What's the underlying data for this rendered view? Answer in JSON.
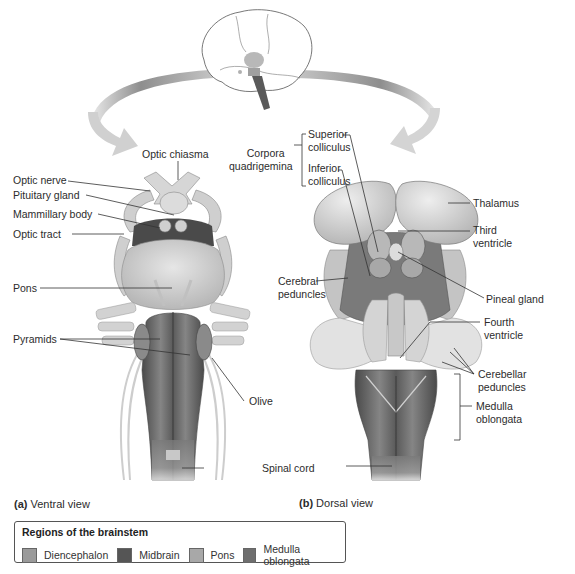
{
  "figure": {
    "views": [
      {
        "id": "a",
        "letter": "(a)",
        "name": "Ventral view"
      },
      {
        "id": "b",
        "letter": "(b)",
        "name": "Dorsal view"
      }
    ],
    "ventral_labels": {
      "optic_nerve": "Optic nerve",
      "optic_chiasma": "Optic chiasma",
      "pituitary_gland": "Pituitary gland",
      "mammillary_body": "Mammillary body",
      "optic_tract": "Optic tract",
      "pons": "Pons",
      "pyramids": "Pyramids",
      "olive": "Olive",
      "spinal_cord": "Spinal cord"
    },
    "dorsal_labels": {
      "corpora_quadrigemina_1": "Corpora",
      "corpora_quadrigemina_2": "quadrigemina",
      "superior_colliculus_1": "Superior",
      "superior_colliculus_2": "colliculus",
      "inferior_colliculus_1": "Inferior",
      "inferior_colliculus_2": "colliculus",
      "thalamus": "Thalamus",
      "third_ventricle_1": "Third",
      "third_ventricle_2": "ventricle",
      "cerebral_peduncles_1": "Cerebral",
      "cerebral_peduncles_2": "peduncles",
      "pineal_gland": "Pineal gland",
      "fourth_ventricle_1": "Fourth",
      "fourth_ventricle_2": "ventricle",
      "cerebellar_peduncles_1": "Cerebellar",
      "cerebellar_peduncles_2": "peduncles",
      "medulla_oblongata_1": "Medulla",
      "medulla_oblongata_2": "oblongata"
    },
    "legend": {
      "title": "Regions of the brainstem",
      "items": [
        {
          "label": "Diencephalon",
          "color": "#9a9a9a"
        },
        {
          "label": "Midbrain",
          "color": "#555555"
        },
        {
          "label": "Pons",
          "color": "#a8a8a8"
        },
        {
          "label": "Medulla oblongata",
          "color": "#6e6e6e"
        }
      ]
    },
    "colors": {
      "arrow": "#9c9c9c",
      "tissue_light": "#dcdcdc",
      "tissue_mid": "#b5b5b5",
      "tissue_dark": "#707070",
      "leader_line": "#333333"
    }
  }
}
